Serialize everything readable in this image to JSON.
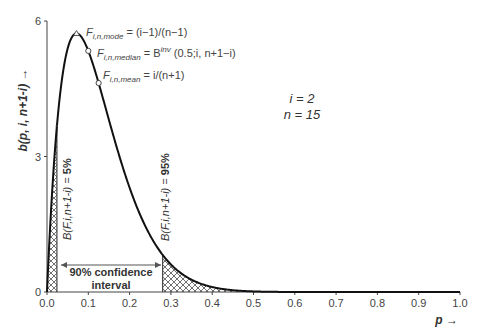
{
  "chart_data": {
    "type": "line",
    "title": "",
    "xlabel": "p →",
    "ylabel": "b(p, i, n+1-i) →",
    "xlim": [
      0.0,
      1.0
    ],
    "ylim": [
      0,
      6
    ],
    "grid": false,
    "x_ticks": [
      "0.0",
      "0.1",
      "0.2",
      "0.3",
      "0.4",
      "0.5",
      "0.6",
      "0.7",
      "0.8",
      "0.9",
      "1.0"
    ],
    "y_ticks": [
      "0",
      "3",
      "6"
    ],
    "params": {
      "i": 2,
      "n": 15
    },
    "series": [
      {
        "name": "Beta pdf b(p; 2, 14)",
        "x": [
          0.0,
          0.01,
          0.02,
          0.024,
          0.03,
          0.04,
          0.05,
          0.06,
          0.0714,
          0.08,
          0.1,
          0.125,
          0.15,
          0.2,
          0.25,
          0.28,
          0.3,
          0.35,
          0.4,
          0.45,
          0.5,
          0.6,
          0.7,
          0.8,
          0.9,
          1.0
        ],
        "values": [
          0,
          1.84,
          3.23,
          3.7,
          4.28,
          5.01,
          5.48,
          5.68,
          5.72,
          5.66,
          5.34,
          4.8,
          3.88,
          2.31,
          1.25,
          0.81,
          0.61,
          0.31,
          0.15,
          0.06,
          0.02,
          0.0,
          0.0,
          0.0,
          0.0,
          0
        ]
      }
    ],
    "annotations": {
      "mode": {
        "p": 0.0714,
        "y": 5.72,
        "label": "F_{i,n,mode} = (i−1)/(n−1)"
      },
      "median": {
        "p": 0.1,
        "y": 5.25,
        "label": "F_{i,n,median} = B^{inv}(0.5; i, n+1−i)"
      },
      "mean": {
        "p": 0.125,
        "y": 4.8,
        "label": "F_{i,n,mean} = i/(n+1)"
      },
      "lower_bound": {
        "p": 0.024,
        "label": "B(F, i, n+1-i) = 5%"
      },
      "upper_bound": {
        "p": 0.28,
        "label": "B(F, i, n+1-i) = 95%"
      },
      "interval": {
        "from": 0.024,
        "to": 0.28,
        "label": "90% confidence interval"
      }
    },
    "legend": null
  },
  "labels": {
    "y_axis_label": "b(p, i, n+1-i) →",
    "x_axis_label": "p →",
    "param_i": "i = 2",
    "param_n": "n = 15",
    "mode_main": "F",
    "mode_sub": "i,n,mode",
    "mode_rhs": " = (i−1)/(n−1)",
    "median_main": "F",
    "median_sub": "i,n,median",
    "median_rhs1": " = B",
    "median_sup": "inv",
    "median_rhs2": " (0.5;i, n+1−i)",
    "mean_main": "F",
    "mean_sub": "i,n,mean",
    "mean_rhs": " = i/(n+1)",
    "lower_label_a": "B(F,i,n+1-i) = ",
    "lower_label_b": "5%",
    "upper_label_a": "B(F,i,n+1-i) = ",
    "upper_label_b": "95%",
    "interval_line1": "90% confidence",
    "interval_line2": "interval"
  },
  "colors": {
    "curve": "#111111",
    "axis": "#444444",
    "hatch": "#333333",
    "text": "#333333"
  }
}
